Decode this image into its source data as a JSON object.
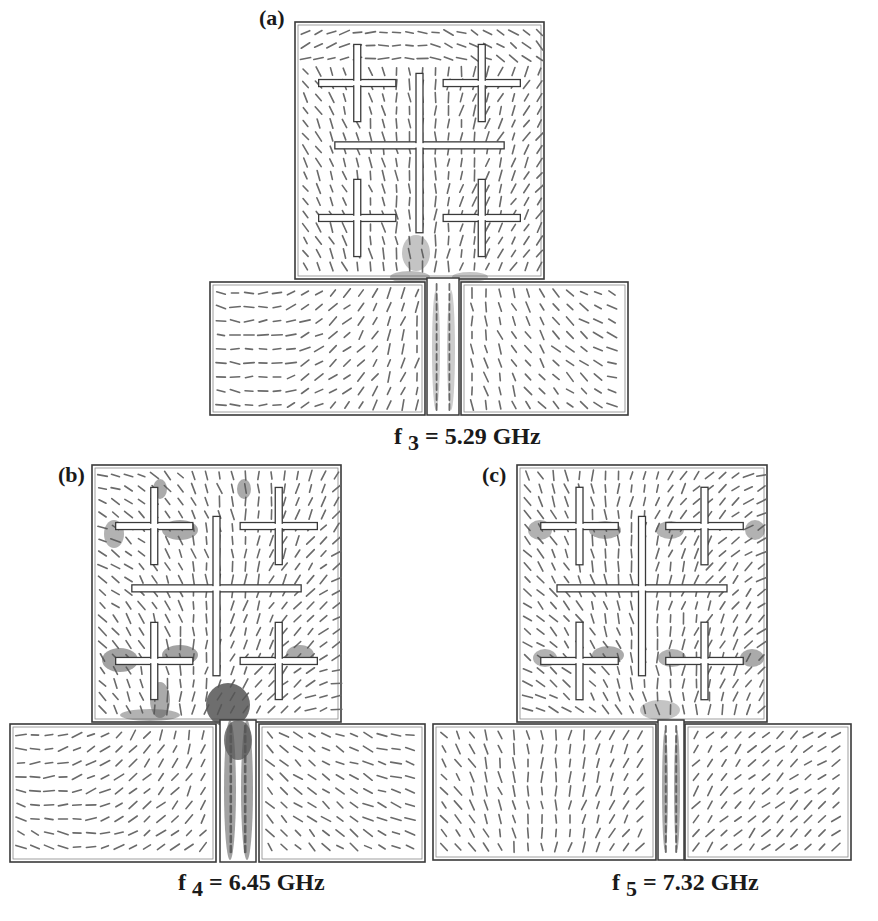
{
  "figure": {
    "panels": [
      {
        "label": "(a)",
        "freq_symbol": "f",
        "freq_index": "3",
        "freq_value": "= 5.29 GHz",
        "highlight": "feed-region"
      },
      {
        "label": "(b)",
        "freq_symbol": "f",
        "freq_index": "4",
        "freq_value": "= 6.45 GHz",
        "highlight": "strong-feed-and-slot-ends"
      },
      {
        "label": "(c)",
        "freq_symbol": "f",
        "freq_index": "5",
        "freq_value": "= 7.32 GHz",
        "highlight": "slot-ends"
      }
    ],
    "colors": {
      "outline": "#3a3a3a",
      "vector": "#6a6a6a",
      "dense_current": "#555555",
      "background": "#ffffff"
    }
  }
}
